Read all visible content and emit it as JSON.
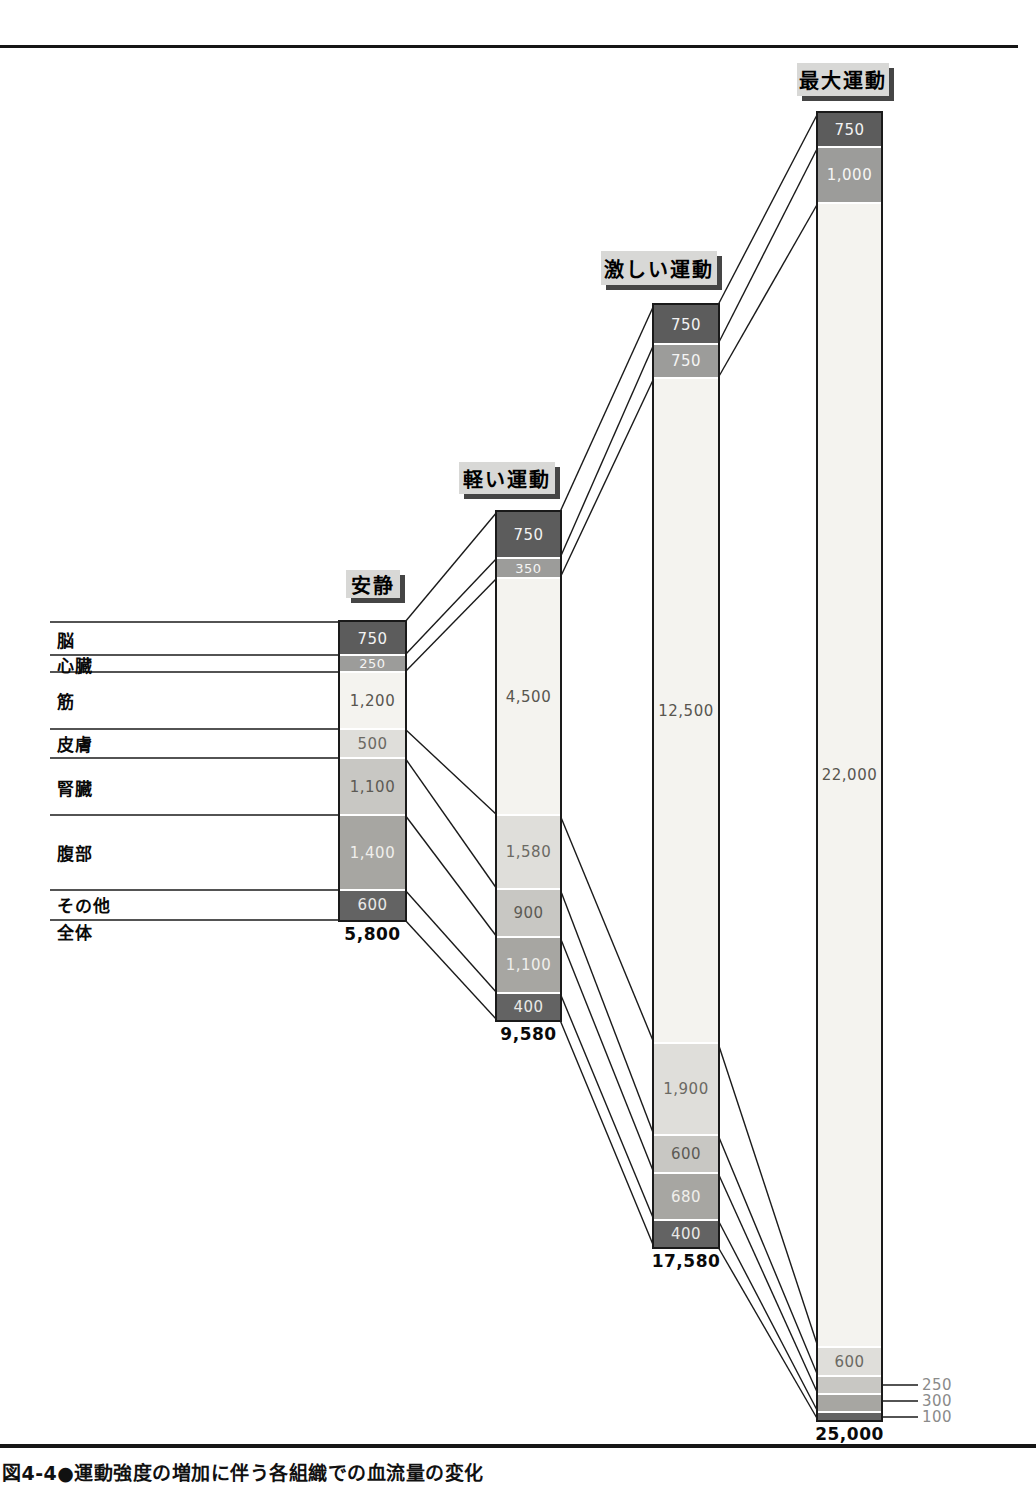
{
  "figure": {
    "caption": "図4-4●運動強度の増加に伴う各組織での血流量の変化"
  },
  "colors": {
    "organ_fills": [
      "#5c5c5c",
      "#9c9c9a",
      "#f4f3ef",
      "#dfdeda",
      "#c8c7c3",
      "#a7a6a2",
      "#636363"
    ],
    "organ_text": [
      "#f2f2f2",
      "#f5f5f4",
      "#58564f",
      "#6b6963",
      "#5c5a54",
      "#f0efec",
      "#e9e9e7"
    ],
    "label_box_bg": "#d8d8d6",
    "label_box_shadow": "#454545",
    "line": "#1a1a1a",
    "outside_label_text": "#8a8a8a",
    "rule": "#161616"
  },
  "chart_data": {
    "type": "bar",
    "subtype": "stacked-flow-columns",
    "title": "図4-4●運動強度の増加に伴う各組織での血流量の変化",
    "categories": [
      "安静",
      "軽い運動",
      "激しい運動",
      "最大運動"
    ],
    "organ_labels": [
      "脳",
      "心臓",
      "筋",
      "皮膚",
      "腎臓",
      "腹部",
      "その他"
    ],
    "total_row_label": "全体",
    "series": [
      {
        "name": "脳",
        "values": [
          750,
          750,
          750,
          750
        ]
      },
      {
        "name": "心臓",
        "values": [
          250,
          350,
          750,
          1000
        ]
      },
      {
        "name": "筋",
        "values": [
          1200,
          4500,
          12500,
          22000
        ]
      },
      {
        "name": "皮膚",
        "values": [
          500,
          1580,
          1900,
          600
        ]
      },
      {
        "name": "腎臓",
        "values": [
          1100,
          900,
          600,
          250
        ]
      },
      {
        "name": "腹部",
        "values": [
          1400,
          1100,
          680,
          300
        ]
      },
      {
        "name": "その他",
        "values": [
          600,
          400,
          400,
          100
        ]
      }
    ],
    "totals": [
      5800,
      9580,
      17580,
      25000
    ],
    "columns": [
      {
        "label": "安静",
        "values": [
          "750",
          "250",
          "1,200",
          "500",
          "1,100",
          "1,400",
          "600"
        ],
        "total_display": "5,800"
      },
      {
        "label": "軽い運動",
        "values": [
          "750",
          "350",
          "4,500",
          "1,580",
          "900",
          "1,100",
          "400"
        ],
        "total_display": "9,580"
      },
      {
        "label": "激しい運動",
        "values": [
          "750",
          "750",
          "12,500",
          "1,900",
          "600",
          "680",
          "400"
        ],
        "total_display": "17,580"
      },
      {
        "label": "最大運動",
        "values": [
          "750",
          "1,000",
          "22,000",
          "600",
          "250",
          "300",
          "100"
        ],
        "total_display": "25,000",
        "outside_value_indices": [
          4,
          5,
          6
        ]
      }
    ],
    "legend_position": "none",
    "grid": false
  }
}
